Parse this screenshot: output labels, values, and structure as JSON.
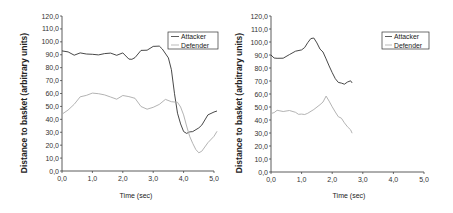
{
  "chart_data": [
    {
      "type": "line",
      "title": "",
      "xlabel": "Time (sec)",
      "ylabel": "Distance to basket (arbitrary units)",
      "xlim": [
        0,
        5
      ],
      "ylim": [
        0,
        120
      ],
      "xticks": [
        "0,0",
        "1,0",
        "2,0",
        "3,0",
        "4,0",
        "5,0"
      ],
      "yticks": [
        "0,0",
        "10,0",
        "20,0",
        "30,0",
        "40,0",
        "50,0",
        "60,0",
        "70,0",
        "80,0",
        "90,0",
        "100,0",
        "110,0",
        "120,0"
      ],
      "grid": false,
      "legend_position": "top-right",
      "series": [
        {
          "name": "Attacker",
          "color": "#333333",
          "x": [
            0.0,
            0.2,
            0.4,
            0.6,
            0.8,
            1.0,
            1.2,
            1.4,
            1.6,
            1.8,
            2.0,
            2.2,
            2.3,
            2.4,
            2.6,
            2.8,
            3.0,
            3.2,
            3.3,
            3.5,
            3.6,
            3.7,
            3.8,
            3.9,
            4.0,
            4.1,
            4.2,
            4.3,
            4.5,
            4.6,
            4.8,
            5.0,
            5.1
          ],
          "y": [
            93,
            92,
            90,
            91,
            91,
            90,
            90,
            91,
            91,
            90,
            91,
            87,
            86,
            88,
            93,
            94,
            96,
            97,
            94,
            88,
            78,
            60,
            45,
            36,
            31,
            29,
            30,
            31,
            33,
            36,
            43,
            46,
            46
          ]
        },
        {
          "name": "Defender",
          "color": "#aaaaaa",
          "x": [
            0.0,
            0.2,
            0.4,
            0.6,
            0.8,
            1.0,
            1.2,
            1.4,
            1.6,
            1.8,
            2.0,
            2.2,
            2.4,
            2.6,
            2.8,
            3.0,
            3.2,
            3.4,
            3.6,
            3.8,
            3.9,
            4.0,
            4.1,
            4.2,
            4.3,
            4.4,
            4.5,
            4.6,
            4.8,
            5.0,
            5.1
          ],
          "y": [
            44,
            47,
            52,
            57,
            59,
            60,
            60,
            59,
            57,
            56,
            58,
            58,
            56,
            50,
            48,
            49,
            52,
            55,
            54,
            53,
            50,
            43,
            35,
            27,
            21,
            17,
            14,
            15,
            22,
            27,
            31
          ]
        }
      ]
    },
    {
      "type": "line",
      "title": "",
      "xlabel": "Time (sec)",
      "ylabel": "Distance to basket (arbitrary units)",
      "xlim": [
        0,
        5
      ],
      "ylim": [
        0,
        120
      ],
      "xticks": [
        "0,0",
        "1,0",
        "2,0",
        "3,0",
        "4,0",
        "5,0"
      ],
      "yticks": [
        "0,0",
        "10,0",
        "20,0",
        "30,0",
        "40,0",
        "50,0",
        "60,0",
        "70,0",
        "80,0",
        "90,0",
        "100,0",
        "110,0",
        "120,0"
      ],
      "grid": false,
      "legend_position": "top-right",
      "series": [
        {
          "name": "Attacker",
          "color": "#333333",
          "x": [
            0.0,
            0.1,
            0.2,
            0.4,
            0.6,
            0.8,
            1.0,
            1.1,
            1.2,
            1.3,
            1.4,
            1.5,
            1.6,
            1.7,
            1.8,
            1.9,
            2.0,
            2.1,
            2.2,
            2.3,
            2.4,
            2.5,
            2.6,
            2.65
          ],
          "y": [
            90,
            88,
            87,
            88,
            90,
            93,
            94,
            96,
            99,
            103,
            103,
            99,
            95,
            92,
            87,
            82,
            76,
            72,
            69,
            68,
            68,
            69,
            70,
            69
          ]
        },
        {
          "name": "Defender",
          "color": "#aaaaaa",
          "x": [
            0.0,
            0.1,
            0.2,
            0.4,
            0.6,
            0.8,
            0.9,
            1.0,
            1.1,
            1.2,
            1.4,
            1.6,
            1.7,
            1.8,
            1.9,
            2.0,
            2.1,
            2.2,
            2.3,
            2.4,
            2.5,
            2.6,
            2.65
          ],
          "y": [
            45,
            46,
            47,
            47,
            47,
            46,
            44,
            45,
            44,
            45,
            48,
            52,
            54,
            58,
            55,
            50,
            46,
            43,
            41,
            38,
            35,
            32,
            30
          ]
        }
      ]
    }
  ],
  "charts": [
    {
      "xlabel": "Time (sec)",
      "ylabel": "Distance to basket (arbitrary units)",
      "legend": [
        "Attacker",
        "Defender"
      ]
    },
    {
      "xlabel": "Time (sec)",
      "ylabel": "Distance to basket (arbitrary units)",
      "legend": [
        "Attacker",
        "Defender"
      ]
    }
  ]
}
